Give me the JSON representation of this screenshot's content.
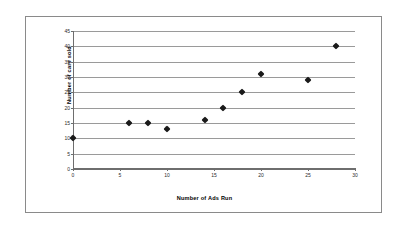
{
  "chart_data": {
    "type": "scatter",
    "title": "",
    "xlabel": "Number of Ads Run",
    "ylabel": "Number of cars sold",
    "xlim": [
      0,
      30
    ],
    "ylim": [
      0,
      45
    ],
    "xticks": [
      0,
      5,
      10,
      15,
      20,
      25,
      30
    ],
    "yticks": [
      0,
      5,
      10,
      15,
      20,
      25,
      30,
      35,
      40,
      45
    ],
    "grid": "horizontal",
    "legend": "none",
    "marker": "diamond",
    "marker_color": "#1a1a1a",
    "series": [
      {
        "name": "Cars sold vs ads run",
        "points": [
          {
            "x": 0,
            "y": 10
          },
          {
            "x": 6,
            "y": 15
          },
          {
            "x": 8,
            "y": 15
          },
          {
            "x": 10,
            "y": 13
          },
          {
            "x": 14,
            "y": 16
          },
          {
            "x": 16,
            "y": 20
          },
          {
            "x": 18,
            "y": 25
          },
          {
            "x": 20,
            "y": 31
          },
          {
            "x": 25,
            "y": 29
          },
          {
            "x": 28,
            "y": 40
          }
        ]
      }
    ]
  }
}
